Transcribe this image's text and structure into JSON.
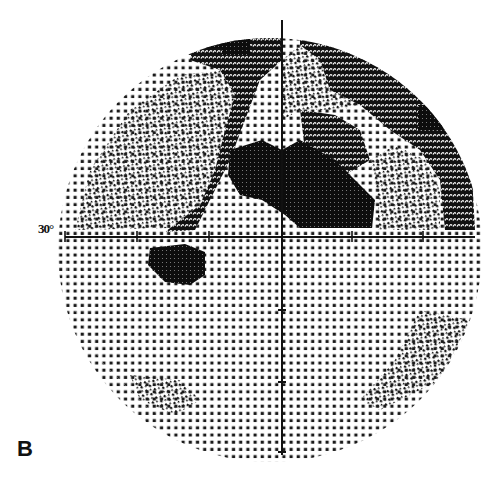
{
  "figure": {
    "panel_label": "B",
    "scale_label": "30°",
    "type": "Humphrey visual field grayscale map (30° test)"
  },
  "axes": {
    "center": [
      282,
      237
    ],
    "horizontal": {
      "x_start": 65,
      "x_end": 475,
      "ticks_x": [
        65,
        137,
        209,
        282,
        352,
        423
      ]
    },
    "vertical": {
      "y_start": 20,
      "y_end": 455,
      "ticks_y": [
        310,
        382,
        452
      ]
    },
    "color": "#111111"
  },
  "field": {
    "center": [
      270,
      250
    ],
    "radius": 212,
    "clip_top": 20,
    "colors": {
      "dot": "#1a1a1a",
      "dense": "#0d0d0d"
    }
  },
  "regions": [
    {
      "name": "superior-arcuate-nasal-dark",
      "level": 4,
      "points": [
        [
          195,
          38
        ],
        [
          250,
          22
        ],
        [
          282,
          20
        ],
        [
          282,
          60
        ],
        [
          260,
          80
        ],
        [
          245,
          120
        ],
        [
          230,
          160
        ],
        [
          210,
          200
        ],
        [
          195,
          230
        ],
        [
          165,
          232
        ],
        [
          200,
          205
        ],
        [
          215,
          170
        ],
        [
          225,
          130
        ],
        [
          235,
          95
        ],
        [
          220,
          70
        ],
        [
          190,
          60
        ]
      ]
    },
    {
      "name": "superior-temporal-arcuate",
      "level": 4,
      "points": [
        [
          300,
          20
        ],
        [
          335,
          25
        ],
        [
          380,
          55
        ],
        [
          420,
          80
        ],
        [
          455,
          100
        ],
        [
          470,
          140
        ],
        [
          475,
          230
        ],
        [
          445,
          230
        ],
        [
          440,
          180
        ],
        [
          420,
          150
        ],
        [
          390,
          130
        ],
        [
          360,
          105
        ],
        [
          330,
          90
        ],
        [
          320,
          60
        ],
        [
          300,
          45
        ]
      ]
    },
    {
      "name": "central-scotoma-dense",
      "level": 5,
      "points": [
        [
          230,
          150
        ],
        [
          262,
          140
        ],
        [
          282,
          150
        ],
        [
          300,
          140
        ],
        [
          335,
          160
        ],
        [
          360,
          185
        ],
        [
          375,
          200
        ],
        [
          372,
          228
        ],
        [
          330,
          228
        ],
        [
          300,
          228
        ],
        [
          285,
          215
        ],
        [
          262,
          200
        ],
        [
          240,
          195
        ],
        [
          228,
          175
        ]
      ]
    },
    {
      "name": "paracentral-mid-dark",
      "level": 4,
      "points": [
        [
          300,
          110
        ],
        [
          335,
          115
        ],
        [
          360,
          130
        ],
        [
          370,
          160
        ],
        [
          345,
          175
        ],
        [
          325,
          160
        ],
        [
          305,
          150
        ]
      ]
    },
    {
      "name": "upper-left-dense-block",
      "level": 5,
      "points": [
        [
          190,
          35
        ],
        [
          250,
          35
        ],
        [
          250,
          55
        ],
        [
          222,
          55
        ],
        [
          222,
          48
        ],
        [
          190,
          48
        ]
      ]
    },
    {
      "name": "top-center-dense-block",
      "level": 5,
      "points": [
        [
          222,
          20
        ],
        [
          262,
          20
        ],
        [
          262,
          35
        ],
        [
          222,
          35
        ]
      ]
    },
    {
      "name": "right-dense-block",
      "level": 5,
      "points": [
        [
          418,
          105
        ],
        [
          455,
          105
        ],
        [
          455,
          130
        ],
        [
          418,
          130
        ]
      ]
    },
    {
      "name": "inferior-nasal-scotoma",
      "level": 5,
      "points": [
        [
          150,
          248
        ],
        [
          185,
          244
        ],
        [
          205,
          252
        ],
        [
          205,
          275
        ],
        [
          190,
          285
        ],
        [
          165,
          282
        ],
        [
          148,
          265
        ]
      ]
    },
    {
      "name": "light-superior-nasal",
      "level": 2,
      "points": [
        [
          75,
          230
        ],
        [
          90,
          170
        ],
        [
          130,
          110
        ],
        [
          180,
          75
        ],
        [
          220,
          70
        ],
        [
          235,
          95
        ],
        [
          225,
          130
        ],
        [
          215,
          170
        ],
        [
          200,
          205
        ],
        [
          170,
          228
        ]
      ]
    },
    {
      "name": "light-superior-center",
      "level": 2,
      "points": [
        [
          282,
          60
        ],
        [
          300,
          45
        ],
        [
          320,
          60
        ],
        [
          330,
          90
        ],
        [
          360,
          105
        ],
        [
          340,
          110
        ],
        [
          300,
          110
        ],
        [
          282,
          120
        ]
      ]
    },
    {
      "name": "light-superior-temporal",
      "level": 2,
      "points": [
        [
          395,
          145
        ],
        [
          425,
          160
        ],
        [
          440,
          190
        ],
        [
          440,
          230
        ],
        [
          378,
          230
        ],
        [
          378,
          200
        ],
        [
          370,
          160
        ]
      ]
    },
    {
      "name": "lower-field",
      "level": 1,
      "points": [
        [
          65,
          240
        ],
        [
          475,
          240
        ],
        [
          470,
          300
        ],
        [
          440,
          370
        ],
        [
          390,
          420
        ],
        [
          330,
          440
        ],
        [
          220,
          440
        ],
        [
          150,
          410
        ],
        [
          100,
          360
        ],
        [
          70,
          300
        ]
      ]
    },
    {
      "name": "inferior-temporal-sparse",
      "level": 2,
      "points": [
        [
          420,
          310
        ],
        [
          470,
          320
        ],
        [
          440,
          380
        ],
        [
          380,
          410
        ],
        [
          360,
          400
        ],
        [
          395,
          360
        ]
      ]
    },
    {
      "name": "inferior-nasal-sparse",
      "level": 2,
      "points": [
        [
          130,
          375
        ],
        [
          180,
          380
        ],
        [
          200,
          400
        ],
        [
          175,
          415
        ],
        [
          140,
          400
        ]
      ]
    }
  ],
  "legend": {
    "levels": [
      {
        "level": 1,
        "meaning": "normal sensitivity (sparse dots)"
      },
      {
        "level": 2,
        "meaning": "mild depression (fine dots)"
      },
      {
        "level": 4,
        "meaning": "moderate depression (cross-hatch)"
      },
      {
        "level": 5,
        "meaning": "absolute scotoma (solid black)"
      }
    ]
  }
}
